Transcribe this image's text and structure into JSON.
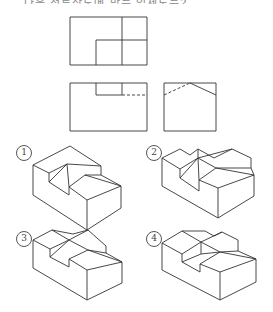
{
  "header": {
    "text": "다음 정투상도에 맞는 입체도는?"
  },
  "views": {
    "top_view": {
      "label": "평면도"
    },
    "front_view": {
      "label": "정면도"
    },
    "side_view": {
      "label": "우측면도"
    }
  },
  "options": [
    {
      "number": "1",
      "symbol": "①"
    },
    {
      "number": "2",
      "symbol": "②"
    },
    {
      "number": "3",
      "symbol": "③"
    },
    {
      "number": "4",
      "symbol": "④"
    }
  ],
  "colors": {
    "line": "#333333",
    "background": "#ffffff"
  }
}
